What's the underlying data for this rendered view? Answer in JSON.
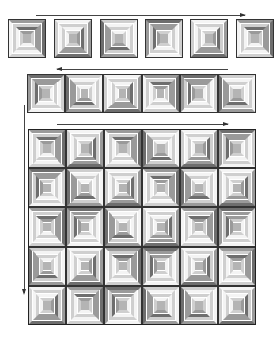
{
  "figure": {
    "colors": {
      "d": "#6e6e6e",
      "m": "#9a9a9a",
      "l": "#cfcfcf",
      "w": "#f4f4f4",
      "c": "#b4b4b4",
      "line": "#333333"
    }
  },
  "top_row": {
    "arrow": {
      "x1": 36,
      "x2": 245,
      "y": 15,
      "direction": "right"
    },
    "blocks": [
      {
        "x": 8,
        "y": 19,
        "rot": 0
      },
      {
        "x": 54,
        "y": 19,
        "rot": 1
      },
      {
        "x": 100,
        "y": 19,
        "rot": 2
      },
      {
        "x": 145,
        "y": 19,
        "rot": 3
      },
      {
        "x": 190,
        "y": 19,
        "rot": 1
      },
      {
        "x": 236,
        "y": 19,
        "rot": 0
      }
    ]
  },
  "middle_row": {
    "arrow": {
      "x1": 57,
      "x2": 228,
      "y": 69,
      "direction": "left"
    },
    "origin": {
      "x": 27,
      "y": 74
    },
    "cols": 6,
    "rots": [
      3,
      2,
      1,
      0,
      3,
      2
    ]
  },
  "quilt_grid": {
    "arrow_top": {
      "x1": 57,
      "x2": 228,
      "y": 124,
      "direction": "right"
    },
    "arrow_left": {
      "x": 24,
      "y1": 105,
      "y2": 293,
      "direction": "down"
    },
    "origin": {
      "x": 28,
      "y": 129
    },
    "cols": 6,
    "rows": 5,
    "cell_w": 38,
    "cell_h": 39.2,
    "rots": [
      [
        0,
        1,
        0,
        2,
        1,
        3
      ],
      [
        3,
        2,
        1,
        0,
        2,
        1
      ],
      [
        0,
        3,
        2,
        1,
        0,
        3
      ],
      [
        2,
        1,
        0,
        3,
        1,
        0
      ],
      [
        1,
        0,
        3,
        2,
        2,
        1
      ]
    ]
  },
  "ring_pattern": [
    [
      "m",
      "d",
      "l",
      "w"
    ],
    [
      "l",
      "m",
      "w",
      "l"
    ],
    [
      "d",
      "m",
      "l",
      "w"
    ],
    [
      "m",
      "l",
      "w",
      "l"
    ]
  ]
}
